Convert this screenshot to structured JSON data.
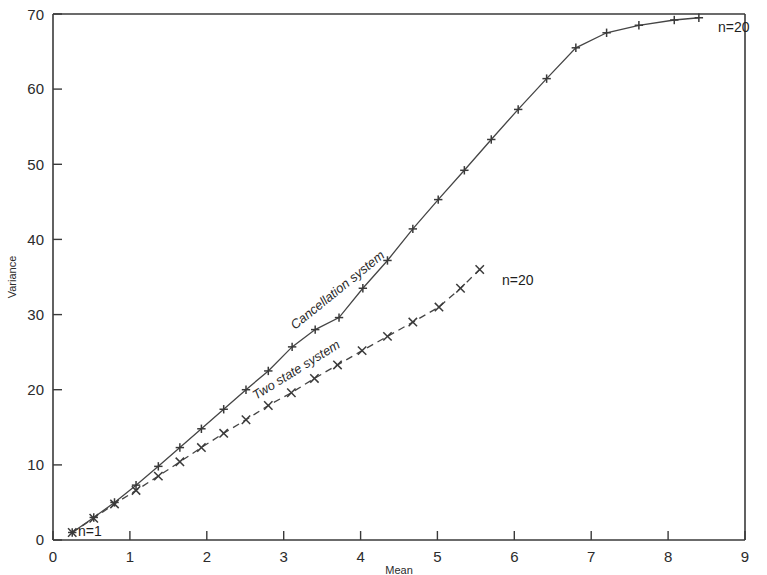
{
  "chart_data": {
    "type": "line",
    "title": "",
    "xlabel": "Mean",
    "ylabel": "Variance",
    "xlim": [
      0,
      9
    ],
    "ylim": [
      0,
      70
    ],
    "grid": false,
    "legend_position": "inline-labels",
    "xticks": [
      0,
      1,
      2,
      3,
      4,
      5,
      6,
      7,
      8,
      9
    ],
    "xtick_labels": [
      "0",
      "1",
      "2",
      "3",
      "4",
      "5",
      "6",
      "7",
      "8",
      "9"
    ],
    "yticks": [
      0,
      10,
      20,
      30,
      40,
      50,
      60,
      70
    ],
    "ytick_labels": [
      "0",
      "10",
      "20",
      "30",
      "40",
      "50",
      "60",
      "70"
    ],
    "series": [
      {
        "name": "Cancellation system",
        "style": "solid",
        "marker": "plus",
        "label_text": "Cancellation system",
        "start_annotation": "n=1",
        "end_annotation": "n=20",
        "x": [
          0.25,
          0.53,
          0.8,
          1.08,
          1.37,
          1.65,
          1.93,
          2.22,
          2.51,
          2.8,
          3.11,
          3.41,
          3.72,
          4.03,
          4.35,
          4.68,
          5.01,
          5.35,
          5.7,
          6.05,
          6.42,
          6.8,
          7.2,
          7.62,
          8.08,
          8.4
        ],
        "y": [
          1.0,
          3.0,
          5.0,
          7.3,
          9.8,
          12.3,
          14.8,
          17.4,
          20.0,
          22.5,
          25.7,
          28.0,
          29.6,
          33.5,
          37.2,
          41.4,
          45.3,
          49.2,
          53.3,
          57.3,
          61.4,
          65.5,
          67.5,
          68.5,
          69.2,
          69.5
        ]
      },
      {
        "name": "Two state system",
        "style": "dashed",
        "marker": "cross",
        "label_text": "Two state system",
        "start_annotation": "n=1",
        "end_annotation": "n=20",
        "x": [
          0.25,
          0.53,
          0.8,
          1.08,
          1.37,
          1.65,
          1.93,
          2.22,
          2.51,
          2.8,
          3.1,
          3.4,
          3.7,
          4.02,
          4.35,
          4.68,
          5.02,
          5.3,
          5.55
        ],
        "y": [
          1.0,
          2.9,
          4.8,
          6.6,
          8.5,
          10.4,
          12.3,
          14.2,
          16.0,
          17.9,
          19.6,
          21.5,
          23.3,
          25.2,
          27.1,
          29.0,
          31.0,
          33.5,
          36.0
        ]
      }
    ],
    "annotations": [
      {
        "text": "n=1",
        "x": 0.3,
        "y": 1.0,
        "note": "lower-left start of both curves"
      },
      {
        "text": "n=20",
        "x": 8.45,
        "y": 69.0,
        "note": "end of Cancellation system curve"
      },
      {
        "text": "n=20",
        "x": 5.7,
        "y": 35.0,
        "note": "end of Two state system curve"
      }
    ]
  },
  "axes": {
    "x_title": "Mean",
    "y_title": "Variance"
  },
  "labels": {
    "series_one": "Cancellation system",
    "series_two": "Two state system",
    "n_start": "n=1",
    "n_end_solid": "n=20",
    "n_end_dashed": "n=20"
  },
  "colors": {
    "ink": "#3a3a3a",
    "line": "#454545",
    "background": "#ffffff"
  }
}
